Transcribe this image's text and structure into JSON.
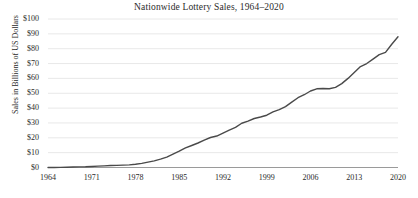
{
  "chart_data": {
    "type": "line",
    "title": "Nationwide Lottery Sales, 1964–2020",
    "xlabel": "",
    "ylabel": "Sales in Billions of US Dollars",
    "xlim": [
      1964,
      2020
    ],
    "ylim": [
      0,
      100
    ],
    "grid": true,
    "legend": false,
    "y_ticks": [
      0,
      10,
      20,
      30,
      40,
      50,
      60,
      70,
      80,
      90,
      100
    ],
    "y_tick_labels": [
      "$0",
      "$10",
      "$20",
      "$30",
      "$40",
      "$50",
      "$60",
      "$70",
      "$80",
      "$90",
      "$100"
    ],
    "x_ticks": [
      1964,
      1971,
      1978,
      1985,
      1992,
      1999,
      2006,
      2013,
      2020
    ],
    "x_tick_labels": [
      "1964",
      "1971",
      "1978",
      "1985",
      "1992",
      "1999",
      "2006",
      "2013",
      "2020"
    ],
    "series": [
      {
        "name": "Nationwide Lottery Sales",
        "color": "#4a4a4a",
        "x": [
          1964,
          1965,
          1966,
          1967,
          1968,
          1969,
          1970,
          1971,
          1972,
          1973,
          1974,
          1975,
          1976,
          1977,
          1978,
          1979,
          1980,
          1981,
          1982,
          1983,
          1984,
          1985,
          1986,
          1987,
          1988,
          1989,
          1990,
          1991,
          1992,
          1993,
          1994,
          1995,
          1996,
          1997,
          1998,
          1999,
          2000,
          2001,
          2002,
          2003,
          2004,
          2005,
          2006,
          2007,
          2008,
          2009,
          2010,
          2011,
          2012,
          2013,
          2014,
          2015,
          2016,
          2017,
          2018,
          2019,
          2020
        ],
        "y": [
          0.0,
          0.0,
          0.1,
          0.2,
          0.3,
          0.4,
          0.5,
          0.7,
          0.9,
          1.1,
          1.3,
          1.4,
          1.6,
          1.8,
          2.2,
          2.8,
          3.6,
          4.5,
          5.6,
          7.0,
          9.0,
          11.0,
          13.2,
          14.8,
          16.5,
          18.4,
          20.2,
          21.2,
          23.2,
          25.2,
          27.0,
          29.8,
          31.2,
          33.0,
          34.0,
          35.2,
          37.5,
          39.0,
          41.0,
          44.0,
          47.0,
          49.0,
          51.5,
          53.0,
          53.2,
          53.0,
          54.0,
          56.5,
          60.0,
          64.0,
          68.0,
          70.0,
          73.0,
          76.0,
          77.5,
          83.0,
          88.0
        ]
      }
    ]
  },
  "icons": {
    "chart_line": "line-chart-icon"
  }
}
